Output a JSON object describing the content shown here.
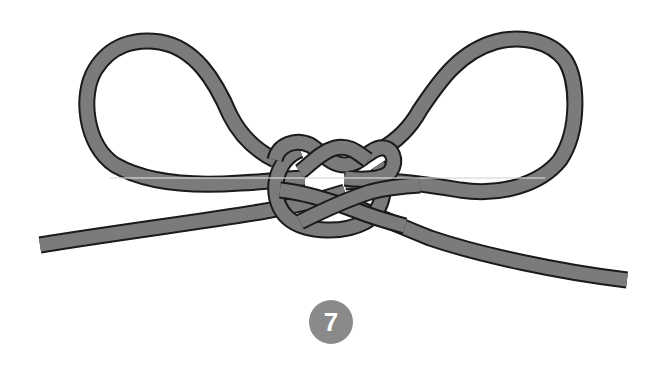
{
  "diagram": {
    "colors": {
      "rope": "#7b7b7b",
      "outline": "#1a1a1a",
      "background": "#ffffff",
      "badge": "#8a8a8a",
      "badge_text": "#ffffff"
    },
    "step": {
      "number": "7"
    },
    "parts": [
      "left-loop",
      "right-loop",
      "left-tail",
      "right-tail",
      "center-knot"
    ]
  }
}
